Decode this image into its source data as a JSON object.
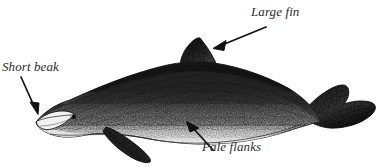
{
  "figure": {
    "style": "scientific pen-and-ink engraving",
    "background_color": "#ffffff",
    "ink_color": "#1b1b1b",
    "label_color": "#2b2b2b"
  },
  "annotations": [
    {
      "id": "large-fin",
      "label": "Large fin",
      "points_to": "dorsal-fin",
      "arrow_from": [
        266,
        27
      ],
      "arrow_to": [
        214,
        48
      ]
    },
    {
      "id": "short-beak",
      "label": "Short beak",
      "points_to": "rostrum",
      "arrow_from": [
        21,
        77
      ],
      "arrow_to": [
        38,
        114
      ]
    },
    {
      "id": "pale-flanks",
      "label": "Pale flanks",
      "points_to": "flank",
      "arrow_from": [
        213,
        150
      ],
      "arrow_to": [
        187,
        122
      ]
    }
  ],
  "anatomy": {
    "dorsal_fin": "falcate dorsal fin, apex near top of back",
    "rostrum": "short stubby beak at front of head",
    "flank": "pale stippled flank below dark cape",
    "flukes": "broad notched tail flukes at rear",
    "flipper": "pectoral flipper sweeping down and back",
    "eye": "small dark eye behind the melon"
  }
}
